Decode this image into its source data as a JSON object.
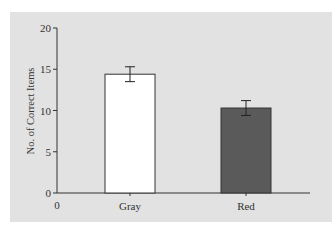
{
  "chart_data": {
    "type": "bar",
    "title": "",
    "xlabel": "",
    "ylabel": "No. of Correct Items",
    "categories": [
      "Gray",
      "Red"
    ],
    "values": [
      14.4,
      10.3
    ],
    "error": [
      0.9,
      0.9
    ],
    "colors": [
      "#ffffff",
      "#5a5a5a"
    ],
    "ylim": [
      0,
      20
    ],
    "yticks": [
      0,
      5,
      10,
      15,
      20
    ],
    "x_origin_label": "0",
    "grid": false,
    "legend": null
  },
  "colors": {
    "panel_background": "#e2e2e2",
    "axis": "#333333",
    "bar_gray": "#ffffff",
    "bar_red": "#5a5a5a"
  }
}
